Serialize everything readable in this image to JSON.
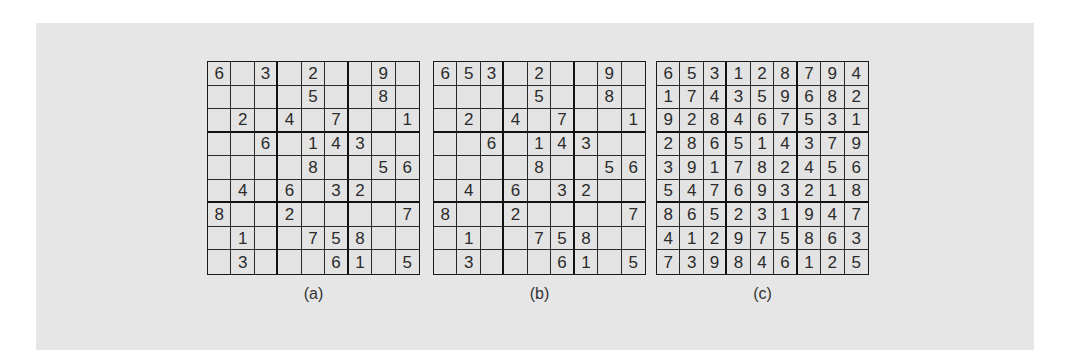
{
  "figures": [
    {
      "id": "a",
      "caption": "(a)",
      "grid": [
        [
          "6",
          "",
          "3",
          "",
          "2",
          "",
          "",
          "9",
          ""
        ],
        [
          "",
          "",
          "",
          "",
          "5",
          "",
          "",
          "8",
          ""
        ],
        [
          "",
          "2",
          "",
          "4",
          "",
          "7",
          "",
          "",
          "1"
        ],
        [
          "",
          "",
          "6",
          "",
          "1",
          "4",
          "3",
          "",
          ""
        ],
        [
          "",
          "",
          "",
          "",
          "8",
          "",
          "",
          "5",
          "6"
        ],
        [
          "",
          "4",
          "",
          "6",
          "",
          "3",
          "2",
          "",
          ""
        ],
        [
          "8",
          "",
          "",
          "2",
          "",
          "",
          "",
          "",
          "7"
        ],
        [
          "",
          "1",
          "",
          "",
          "7",
          "5",
          "8",
          "",
          ""
        ],
        [
          "",
          "3",
          "",
          "",
          "",
          "6",
          "1",
          "",
          "5"
        ]
      ]
    },
    {
      "id": "b",
      "caption": "(b)",
      "grid": [
        [
          "6",
          "5",
          "3",
          "",
          "2",
          "",
          "",
          "9",
          ""
        ],
        [
          "",
          "",
          "",
          "",
          "5",
          "",
          "",
          "8",
          ""
        ],
        [
          "",
          "2",
          "",
          "4",
          "",
          "7",
          "",
          "",
          "1"
        ],
        [
          "",
          "",
          "6",
          "",
          "1",
          "4",
          "3",
          "",
          ""
        ],
        [
          "",
          "",
          "",
          "",
          "8",
          "",
          "",
          "5",
          "6"
        ],
        [
          "",
          "4",
          "",
          "6",
          "",
          "3",
          "2",
          "",
          ""
        ],
        [
          "8",
          "",
          "",
          "2",
          "",
          "",
          "",
          "",
          "7"
        ],
        [
          "",
          "1",
          "",
          "",
          "7",
          "5",
          "8",
          "",
          ""
        ],
        [
          "",
          "3",
          "",
          "",
          "",
          "6",
          "1",
          "",
          "5"
        ]
      ]
    },
    {
      "id": "c",
      "caption": "(c)",
      "grid": [
        [
          "6",
          "5",
          "3",
          "1",
          "2",
          "8",
          "7",
          "9",
          "4"
        ],
        [
          "1",
          "7",
          "4",
          "3",
          "5",
          "9",
          "6",
          "8",
          "2"
        ],
        [
          "9",
          "2",
          "8",
          "4",
          "6",
          "7",
          "5",
          "3",
          "1"
        ],
        [
          "2",
          "8",
          "6",
          "5",
          "1",
          "4",
          "3",
          "7",
          "9"
        ],
        [
          "3",
          "9",
          "1",
          "7",
          "8",
          "2",
          "4",
          "5",
          "6"
        ],
        [
          "5",
          "4",
          "7",
          "6",
          "9",
          "3",
          "2",
          "1",
          "8"
        ],
        [
          "8",
          "6",
          "5",
          "2",
          "3",
          "1",
          "9",
          "4",
          "7"
        ],
        [
          "4",
          "1",
          "2",
          "9",
          "7",
          "5",
          "8",
          "6",
          "3"
        ],
        [
          "7",
          "3",
          "9",
          "8",
          "4",
          "6",
          "1",
          "2",
          "5"
        ]
      ]
    }
  ],
  "colors": {
    "panel_background": "#e6e6e6",
    "page_background": "#ffffff",
    "grid_line": "#1a1a1a",
    "digit": "#2b2b2b"
  }
}
